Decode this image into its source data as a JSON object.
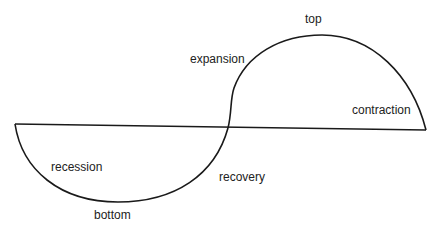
{
  "diagram": {
    "type": "business-cycle",
    "labels": {
      "top": "top",
      "expansion": "expansion",
      "contraction": "contraction",
      "recession": "recession",
      "recovery": "recovery",
      "bottom": "bottom"
    },
    "colors": {
      "line": "#1a1a1a",
      "text": "#222222",
      "background": "#ffffff"
    }
  }
}
